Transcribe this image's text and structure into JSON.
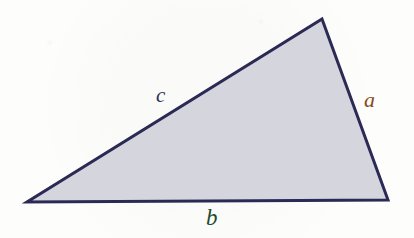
{
  "figure": {
    "name": "scalene-triangle-with-side-labels",
    "background_color": "#fdfdfc",
    "triangle": {
      "fill_color": "#d5d5dd",
      "stroke_color": "#2a2a55",
      "stroke_width": 3,
      "points": "322,19 388,200 27,202",
      "vertices": [
        {
          "name": "apex",
          "x": 322,
          "y": 19
        },
        {
          "name": "bottom-right",
          "x": 388,
          "y": 200
        },
        {
          "name": "bottom-left",
          "x": 27,
          "y": 202
        }
      ]
    },
    "labels": [
      {
        "id": "a",
        "text": "a",
        "side": "right-side",
        "color": "#8a4a20",
        "x": 370,
        "y": 100
      },
      {
        "id": "b",
        "text": "b",
        "side": "bottom-side",
        "color": "#1f4a2a",
        "x": 213,
        "y": 218
      },
      {
        "id": "c",
        "text": "c",
        "side": "hypotenuse",
        "color": "#2f3050",
        "x": 163,
        "y": 96
      }
    ]
  }
}
